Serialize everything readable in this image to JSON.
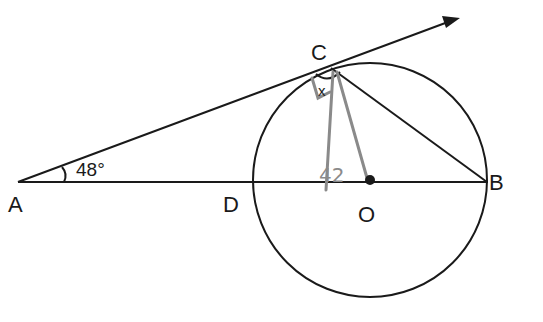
{
  "diagram": {
    "points": {
      "A": {
        "label": "A",
        "x": 18,
        "y": 182
      },
      "B": {
        "label": "B",
        "x": 487,
        "y": 182
      },
      "C": {
        "label": "C",
        "x": 330,
        "y": 67
      },
      "D": {
        "label": "D",
        "x": 253,
        "y": 182
      },
      "O": {
        "label": "O",
        "x": 370,
        "y": 180
      }
    },
    "angle_A": "48°",
    "angle_C_label": "x",
    "pencil_annotation": "42",
    "circle": {
      "cx": 370,
      "cy": 180,
      "r": 117
    },
    "colors": {
      "ink": "#1a1a1a",
      "pencil": "#8a8a8a"
    }
  }
}
